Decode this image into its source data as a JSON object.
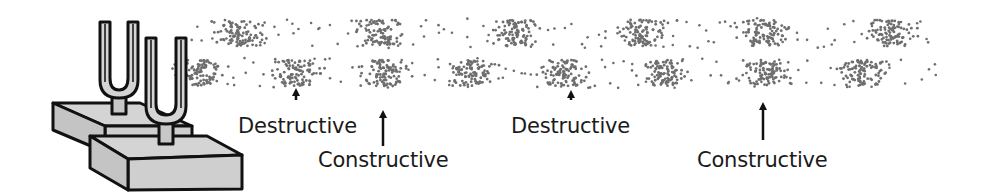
{
  "diagram": {
    "colors": {
      "dot": "#6e6e6e",
      "outline": "#111111",
      "fill": "#d4d4d4",
      "fill_dark": "#bdbdbd",
      "text": "#1a1a1a"
    },
    "waves": [
      {
        "name": "top-wave",
        "y_top": 18,
        "y_bottom": 48,
        "compressions_x": [
          240,
          380,
          515,
          640,
          765,
          890
        ],
        "x_start": 190,
        "x_end": 930
      },
      {
        "name": "bottom-wave",
        "y_top": 58,
        "y_bottom": 88,
        "compressions_x": [
          200,
          295,
          385,
          470,
          565,
          665,
          765,
          860
        ],
        "x_start": 185,
        "x_end": 935
      }
    ],
    "annotations": [
      {
        "id": "destructive-1",
        "text": "Destructive",
        "arrow_x": 296,
        "arrow_top": 88,
        "arrow_bottom": 100,
        "label_x": 238,
        "label_y": 114
      },
      {
        "id": "constructive-1",
        "text": "Constructive",
        "arrow_x": 383,
        "arrow_top": 110,
        "arrow_bottom": 146,
        "label_x": 318,
        "label_y": 148
      },
      {
        "id": "destructive-2",
        "text": "Destructive",
        "arrow_x": 571,
        "arrow_top": 90,
        "arrow_bottom": 100,
        "label_x": 511,
        "label_y": 114
      },
      {
        "id": "constructive-2",
        "text": "Constructive",
        "arrow_x": 763,
        "arrow_top": 102,
        "arrow_bottom": 140,
        "label_x": 697,
        "label_y": 148
      }
    ],
    "labels": {
      "destructive_1": "Destructive",
      "constructive_1": "Constructive",
      "destructive_2": "Destructive",
      "constructive_2": "Constructive"
    }
  }
}
